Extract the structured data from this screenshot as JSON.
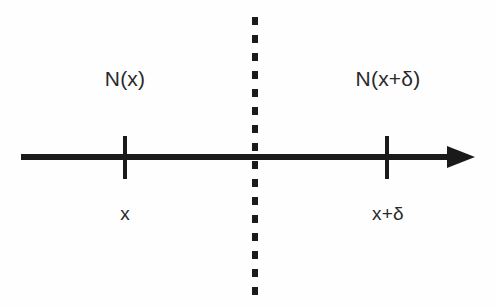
{
  "diagram": {
    "background_color": "#fefefe",
    "ink_color": "#1a1a1a",
    "text_color": "#2a2a2a",
    "axis": {
      "name": "horizontal-number-line",
      "arrow_direction": "right"
    },
    "divider": {
      "name": "vertical-dotted-divider",
      "style": "dotted"
    },
    "region_labels": {
      "left": "N(x)",
      "right": "N(x+δ)"
    },
    "point_labels": {
      "left": "x",
      "right": "x+δ"
    },
    "ticks": [
      {
        "label": "x",
        "region": "N(x)"
      },
      {
        "label": "x+δ",
        "region": "N(x+δ)"
      }
    ]
  }
}
